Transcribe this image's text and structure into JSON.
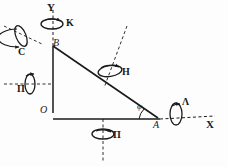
{
  "figure": {
    "type": "technical-line-diagram",
    "background_color": "#fdfdfd",
    "ink_color": "#1a1a1a"
  },
  "axes": {
    "y_label": "Y",
    "x_label": "X",
    "origin_label": "O"
  },
  "points": [
    {
      "name": "origin",
      "label": "O",
      "x": 42,
      "y": 113
    },
    {
      "name": "point-b",
      "label": "В",
      "x": 53,
      "y": 46
    },
    {
      "name": "point-a",
      "label": "A",
      "x": 157,
      "y": 119
    }
  ],
  "angle": {
    "label": "φ",
    "x": 139,
    "y": 107
  },
  "rotations": [
    {
      "name": "rotation-k",
      "label": "K",
      "x": 66,
      "y": 22
    },
    {
      "name": "rotation-c",
      "label": "С",
      "x": 18,
      "y": 52
    },
    {
      "name": "rotation-p-left",
      "label": "П",
      "x": 19,
      "y": 88
    },
    {
      "name": "rotation-h",
      "label": "H",
      "x": 122,
      "y": 71
    },
    {
      "name": "rotation-p-bottom",
      "label": "П",
      "x": 114,
      "y": 133
    },
    {
      "name": "rotation-lambda",
      "label": "Λ",
      "x": 183,
      "y": 100
    }
  ]
}
